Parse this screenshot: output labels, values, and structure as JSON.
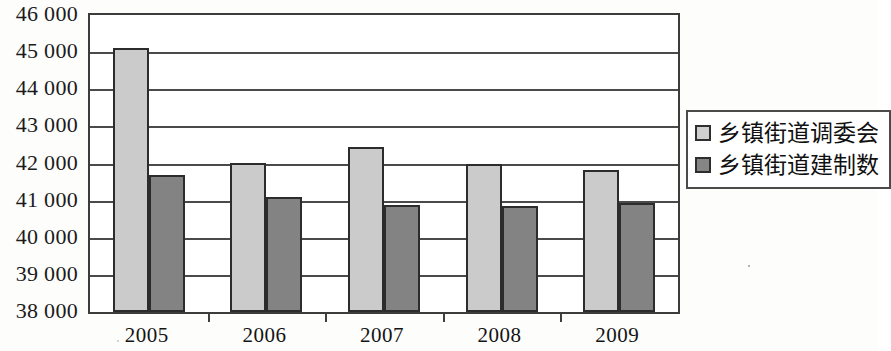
{
  "chart_data": {
    "type": "bar",
    "title": "",
    "subtitle": "",
    "xlabel": "",
    "ylabel": "",
    "categories": [
      "2005",
      "2006",
      "2007",
      "2008",
      "2009"
    ],
    "series": [
      {
        "name": "乡镇街道调委会",
        "color": "#cbcbcb",
        "values": [
          45120,
          42010,
          42450,
          42000,
          41830
        ]
      },
      {
        "name": "乡镇街道建制数",
        "color": "#838383",
        "values": [
          41680,
          41100,
          40870,
          40850,
          40930
        ]
      }
    ],
    "ylim": [
      38000,
      46000
    ],
    "ytick_step": 1000,
    "ytick_labels": [
      "46 000",
      "45 000",
      "44 000",
      "43 000",
      "42 000",
      "41 000",
      "40 000",
      "39 000",
      "38 000"
    ],
    "ytick_values": [
      46000,
      45000,
      44000,
      43000,
      42000,
      41000,
      40000,
      39000,
      38000
    ],
    "grid": true,
    "grid_axis": "y",
    "legend_position": "right",
    "bar_border_color": "#2c2c2c",
    "frame_color": "#3c3c3c",
    "background_color": "#ffffff"
  }
}
